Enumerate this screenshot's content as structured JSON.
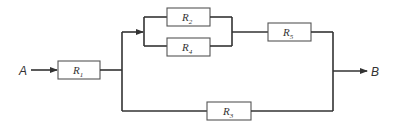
{
  "diagram": {
    "type": "resistor-network",
    "nodes": {
      "input": "A",
      "output": "B"
    },
    "resistors": [
      {
        "id": "R1",
        "letter": "R",
        "sub": "1"
      },
      {
        "id": "R2",
        "letter": "R",
        "sub": "2"
      },
      {
        "id": "R4",
        "letter": "R",
        "sub": "4"
      },
      {
        "id": "R5",
        "letter": "R",
        "sub": "5"
      },
      {
        "id": "R3",
        "letter": "R",
        "sub": "3"
      }
    ],
    "topology": "A -> R1 -> [ ( (R2 || R4) -> R5 ) || R3 ] -> B",
    "colors": {
      "line": "#333333",
      "box": "#555555",
      "background": "#ffffff"
    }
  }
}
